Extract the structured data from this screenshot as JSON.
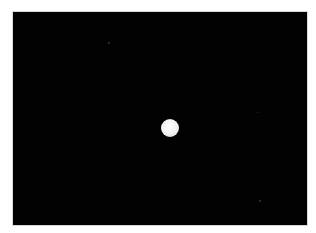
{
  "image": {
    "subject": "bright-disc-in-dark-sky",
    "background_color": "#020202",
    "disc_color": "#f2f2f2"
  }
}
